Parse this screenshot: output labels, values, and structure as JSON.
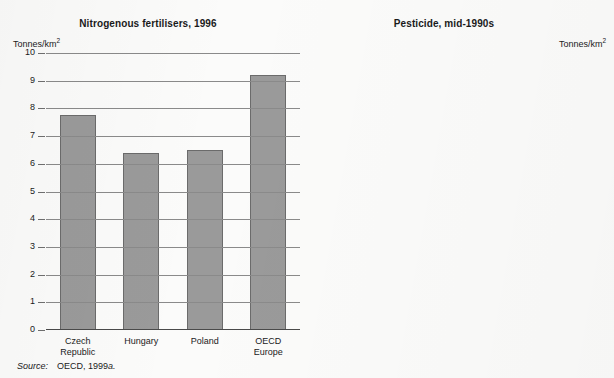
{
  "source_note": {
    "lead": "Source:",
    "body": "OECD, 1999",
    "suffix": "a."
  },
  "charts": [
    {
      "title": "Nitrogenous fertilisers, 1996",
      "unit_prefix": "Tonnes/km",
      "unit_sup": "2",
      "axis_side": "left",
      "ticks": [
        "10",
        "9",
        "8",
        "7",
        "6",
        "5",
        "4",
        "3",
        "2",
        "1",
        "0"
      ],
      "categories": [
        "Czech\nRepublic",
        "Hungary",
        "Poland",
        "OECD\nEurope"
      ],
      "values": [
        7.75,
        6.4,
        6.5,
        9.2
      ]
    },
    {
      "title": "Pesticide, mid-1990s",
      "unit_prefix": "Tonnes/km",
      "unit_sup": "2",
      "axis_side": "right",
      "ticks": [
        "0.35",
        "0.30",
        "0.25",
        "0.20",
        "0.15",
        "0.10",
        "0.05",
        "0"
      ],
      "categories": [
        "Czech\nRepublic",
        "Hungary",
        "Poland",
        "OECD\nEurope"
      ],
      "values": [
        0.12,
        0.148,
        0.048,
        0.3
      ]
    }
  ],
  "chart_data": [
    {
      "type": "bar",
      "title": "Nitrogenous fertilisers, 1996",
      "categories": [
        "Czech Republic",
        "Hungary",
        "Poland",
        "OECD Europe"
      ],
      "values": [
        7.75,
        6.4,
        6.5,
        9.2
      ],
      "xlabel": "",
      "ylabel": "Tonnes/km2",
      "ylim": [
        0,
        10
      ],
      "yticks": [
        0,
        1,
        2,
        3,
        4,
        5,
        6,
        7,
        8,
        9,
        10
      ],
      "grid": true,
      "legend": "none",
      "axis_position": "left",
      "bar_color": "#9a9a9a",
      "bar_edge_color": "#6b6b6b"
    },
    {
      "type": "bar",
      "title": "Pesticide, mid-1990s",
      "categories": [
        "Czech Republic",
        "Hungary",
        "Poland",
        "OECD Europe"
      ],
      "values": [
        0.12,
        0.148,
        0.048,
        0.3
      ],
      "xlabel": "",
      "ylabel": "Tonnes/km2",
      "ylim": [
        0,
        0.35
      ],
      "yticks": [
        0,
        0.05,
        0.1,
        0.15,
        0.2,
        0.25,
        0.3,
        0.35
      ],
      "grid": true,
      "legend": "none",
      "axis_position": "right",
      "bar_color": "#9a9a9a",
      "bar_edge_color": "#6b6b6b"
    }
  ]
}
